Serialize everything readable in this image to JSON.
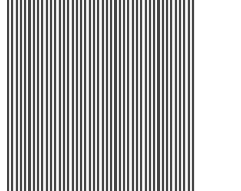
{
  "image": {
    "description": "Vertical black-and-white stripe pattern",
    "pattern": "vertical-stripes",
    "stripe_count": 44,
    "colors": {
      "stripe": "#454545",
      "gap": "#ffffff",
      "background": "#ffffff"
    }
  }
}
